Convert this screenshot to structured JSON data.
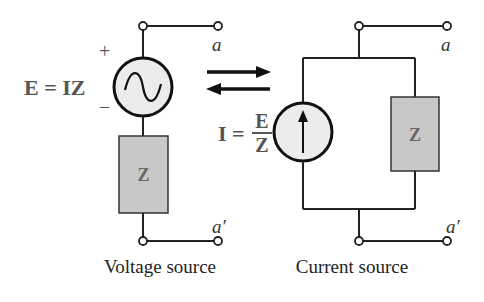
{
  "figure": {
    "voltage_source": {
      "equation": "E = IZ",
      "plus_sign": "+",
      "minus_sign": "−",
      "impedance_label": "Z",
      "terminal_top": "a",
      "terminal_bottom": "a′",
      "caption": "Voltage source",
      "source_icon": "ac-voltage-source-icon"
    },
    "current_source": {
      "equation_lhs": "I =",
      "equation_num": "E",
      "equation_den": "Z",
      "impedance_label": "Z",
      "terminal_top": "a",
      "terminal_bottom": "a′",
      "caption": "Current source",
      "source_icon": "current-source-arrow-icon"
    },
    "conversion_arrows": "bidirectional-arrows-icon",
    "colors": {
      "wire": "#222222",
      "source_fill": "#ececec",
      "impedance_fill": "#c8c8c8",
      "equation_text": "#555555"
    }
  }
}
